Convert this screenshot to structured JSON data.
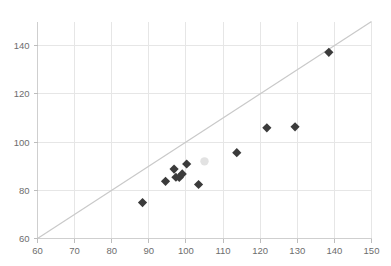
{
  "chart_data": {
    "type": "scatter",
    "title": "",
    "subtitle": "",
    "xlabel": "",
    "ylabel": "",
    "xlim": [
      60,
      150
    ],
    "ylim": [
      60,
      150
    ],
    "xticks": [
      60,
      70,
      80,
      90,
      100,
      110,
      120,
      130,
      140,
      150
    ],
    "xtick_labels": [
      "60",
      "70",
      "80",
      "90",
      "100",
      "110",
      "120",
      "130",
      "140",
      "150"
    ],
    "yticks": [
      60,
      80,
      100,
      120,
      140
    ],
    "ytick_labels": [
      "60",
      "80",
      "100",
      "120",
      "140"
    ],
    "grid": true,
    "legend": null,
    "annotations": [],
    "series": [
      {
        "name": "data",
        "marker": "diamond",
        "color": "#3b3b3b",
        "points": [
          {
            "x": 88.3,
            "y": 74.9
          },
          {
            "x": 94.5,
            "y": 83.7
          },
          {
            "x": 96.8,
            "y": 88.8
          },
          {
            "x": 97.3,
            "y": 85.4
          },
          {
            "x": 98.2,
            "y": 85.3
          },
          {
            "x": 99.0,
            "y": 86.8
          },
          {
            "x": 100.2,
            "y": 90.9
          },
          {
            "x": 103.4,
            "y": 82.4
          },
          {
            "x": 113.7,
            "y": 95.6
          },
          {
            "x": 121.8,
            "y": 105.9
          },
          {
            "x": 129.4,
            "y": 106.3
          },
          {
            "x": 138.5,
            "y": 137.2
          }
        ]
      },
      {
        "name": "faint-point",
        "marker": "circle",
        "color": "#e2e2e2",
        "points": [
          {
            "x": 105.0,
            "y": 92.0
          }
        ]
      }
    ],
    "reference_line": {
      "name": "identity-line",
      "type": "line",
      "color": "#c9c9c9",
      "x": [
        60,
        150
      ],
      "y": [
        60,
        150
      ]
    }
  }
}
